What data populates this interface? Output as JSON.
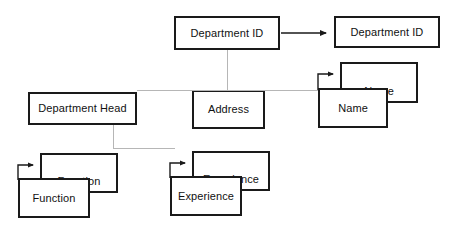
{
  "diagram": {
    "type": "entity-attribute-diagram",
    "canvas": {
      "width": 451,
      "height": 234,
      "background": "#ffffff"
    },
    "colors": {
      "box_border": "#1a1a1a",
      "box_fill": "#ffffff",
      "text": "#111111",
      "connector_line": "#b6b6b6",
      "arrow": "#1a1a1a"
    },
    "nodes": [
      {
        "id": "department-id-source",
        "label": "Department ID",
        "kind": "attribute",
        "x": 174,
        "y": 16,
        "width": 106,
        "height": 34
      },
      {
        "id": "department-id-target",
        "label": "Department ID",
        "kind": "attribute",
        "x": 334,
        "y": 16,
        "width": 106,
        "height": 32
      },
      {
        "id": "department-head",
        "label": "Department Head",
        "kind": "attribute",
        "x": 28,
        "y": 92,
        "width": 109,
        "height": 33
      },
      {
        "id": "address",
        "label": "Address",
        "kind": "attribute",
        "x": 192,
        "y": 90,
        "width": 73,
        "height": 39
      },
      {
        "id": "name-back",
        "label": "Name",
        "kind": "multivalued-back",
        "x": 340,
        "y": 62,
        "width": 78,
        "height": 41
      },
      {
        "id": "name-front",
        "label": "Name",
        "kind": "multivalued-front",
        "x": 318,
        "y": 88,
        "width": 70,
        "height": 40
      },
      {
        "id": "function-back",
        "label": "Function",
        "kind": "multivalued-back",
        "x": 40,
        "y": 153,
        "width": 78,
        "height": 40
      },
      {
        "id": "function-front",
        "label": "Function",
        "kind": "multivalued-front",
        "x": 18,
        "y": 178,
        "width": 72,
        "height": 40
      },
      {
        "id": "experience-back",
        "label": "Experience",
        "kind": "multivalued-back",
        "x": 192,
        "y": 151,
        "width": 78,
        "height": 40
      },
      {
        "id": "experience-front",
        "label": "Experience",
        "kind": "multivalued-front",
        "x": 170,
        "y": 176,
        "width": 72,
        "height": 40
      }
    ],
    "connectors": [
      {
        "id": "dept-id-to-address",
        "orientation": "vertical",
        "x": 227,
        "y": 50,
        "length": 40
      },
      {
        "id": "head-to-name-horizontal",
        "orientation": "horizontal",
        "x": 137,
        "y": 90,
        "length": 181
      },
      {
        "id": "head-down-stub",
        "orientation": "vertical",
        "x": 113,
        "y": 125,
        "length": 24
      },
      {
        "id": "head-to-experience-horizontal",
        "orientation": "horizontal",
        "x": 113,
        "y": 148,
        "length": 62
      }
    ],
    "arrows": [
      {
        "id": "department-id-link",
        "kind": "straight",
        "from": "department-id-source",
        "to": "department-id-target",
        "x1": 281,
        "y1": 33,
        "x2": 332,
        "y2": 33
      },
      {
        "id": "name-hook",
        "kind": "hook",
        "to": "name-back",
        "stub_x": 318,
        "stub_bottom_y": 90,
        "stub_top_y": 74,
        "arrow_x": 338,
        "arrow_y": 74
      },
      {
        "id": "function-hook",
        "kind": "hook",
        "to": "function-back",
        "stub_x": 18,
        "stub_bottom_y": 180,
        "stub_top_y": 165,
        "arrow_x": 38,
        "arrow_y": 165
      },
      {
        "id": "experience-hook",
        "kind": "hook",
        "to": "experience-back",
        "stub_x": 170,
        "stub_bottom_y": 178,
        "stub_top_y": 163,
        "arrow_x": 190,
        "arrow_y": 163
      }
    ]
  }
}
